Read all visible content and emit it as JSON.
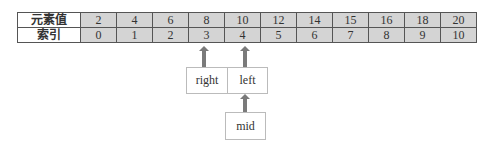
{
  "table": {
    "row_labels": [
      "元素值",
      "索引"
    ],
    "values": [
      "2",
      "4",
      "6",
      "8",
      "10",
      "12",
      "14",
      "15",
      "16",
      "18",
      "20"
    ],
    "indices": [
      "0",
      "1",
      "2",
      "3",
      "4",
      "5",
      "6",
      "7",
      "8",
      "9",
      "10"
    ]
  },
  "pointers": {
    "right": "right",
    "left": "left",
    "mid": "mid"
  }
}
